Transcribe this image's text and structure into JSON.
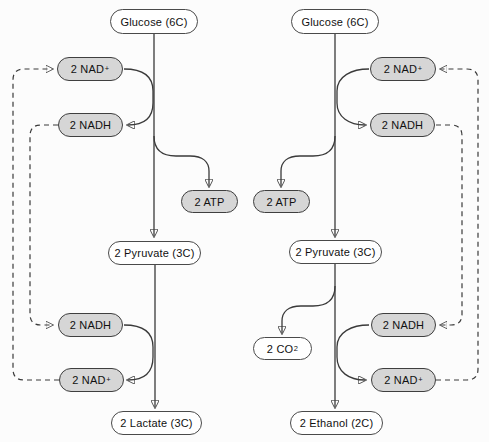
{
  "colors": {
    "cofactor_pill_fill": "#d6d6d6",
    "metabolite_pill_fill": "#ffffff",
    "pill_border": "#3f3f3f",
    "connector_line": "#3a3a3a",
    "text": "#111111",
    "background": "#fcfcfc"
  },
  "left_pathway": {
    "name": "lactate-fermentation",
    "glucose": {
      "text": "Glucose (6C)"
    },
    "nad_top": {
      "text": "2 NAD",
      "sup": "+"
    },
    "nadh_top": {
      "text": "2 NADH"
    },
    "atp": {
      "text": "2 ATP"
    },
    "pyruvate": {
      "text": "2 Pyruvate (3C)"
    },
    "nadh_bottom": {
      "text": "2 NADH"
    },
    "nad_bottom": {
      "text": "2 NAD",
      "sup": "+"
    },
    "product": {
      "text": "2 Lactate (3C)"
    }
  },
  "right_pathway": {
    "name": "alcohol-fermentation",
    "glucose": {
      "text": "Glucose (6C)"
    },
    "nad_top": {
      "text": "2 NAD",
      "sup": "+"
    },
    "nadh_top": {
      "text": "2 NADH"
    },
    "atp": {
      "text": "2 ATP"
    },
    "pyruvate": {
      "text": "2 Pyruvate (3C)"
    },
    "co2": {
      "text": "2 CO",
      "sub": "2"
    },
    "nadh_bottom": {
      "text": "2 NADH"
    },
    "nad_bottom": {
      "text": "2 NAD",
      "sup": "+"
    },
    "product": {
      "text": "2 Ethanol (2C)"
    }
  }
}
